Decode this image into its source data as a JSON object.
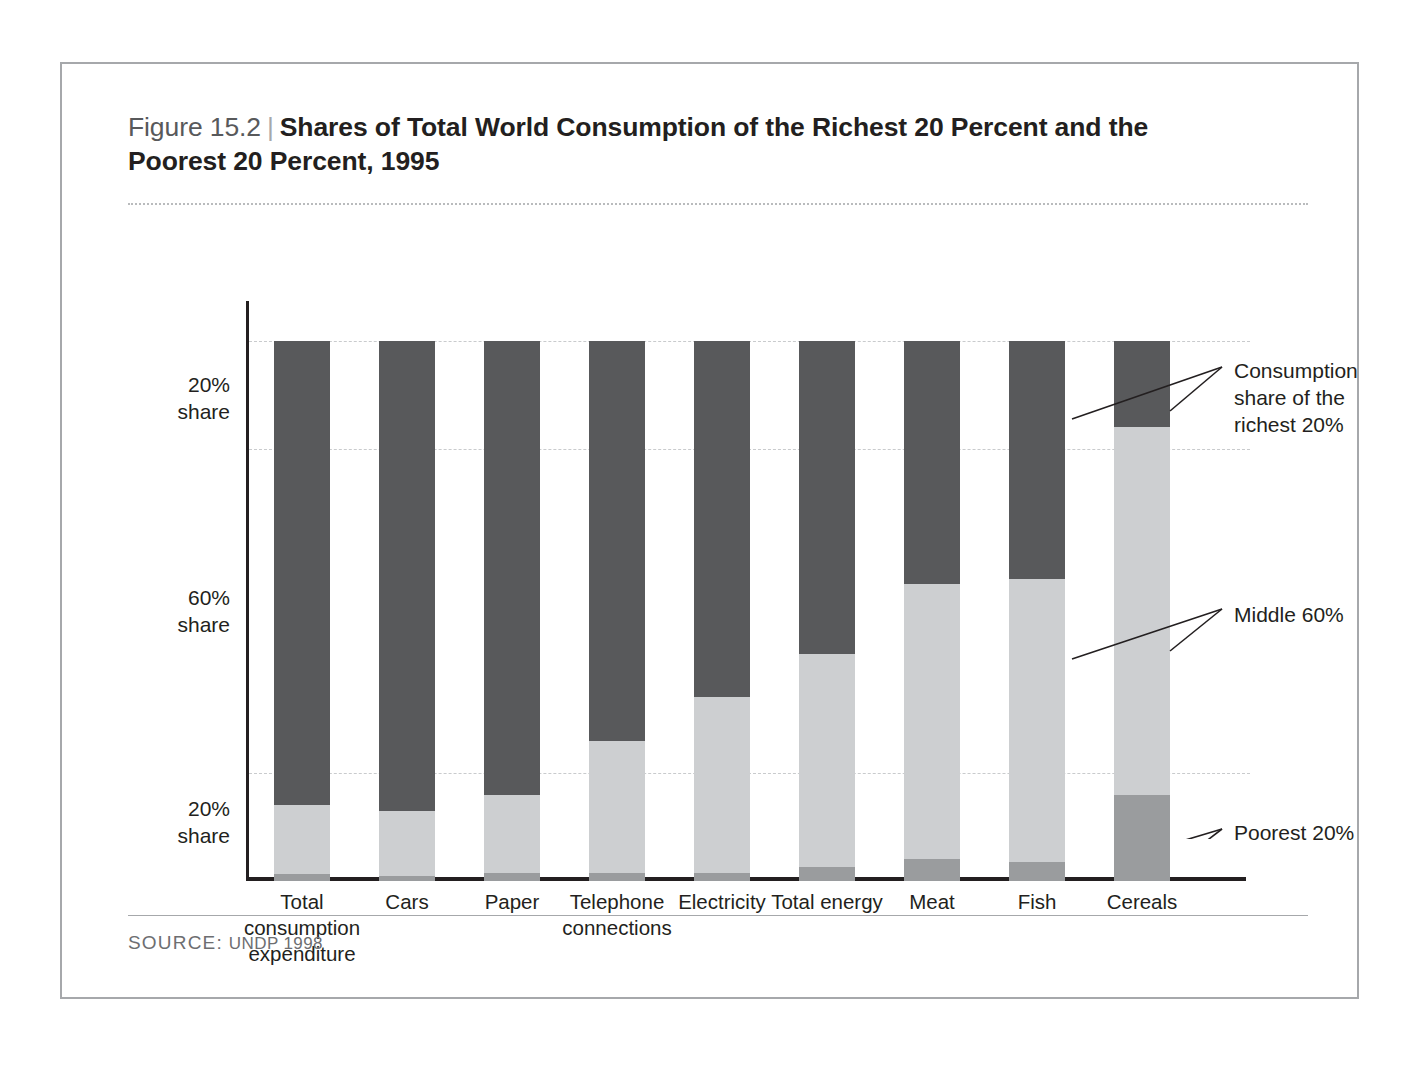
{
  "figure": {
    "number": "Figure 15.2",
    "separator": "|",
    "title": "Shares of Total World Consumption of the Richest 20 Percent and the Poorest 20 Percent, 1995",
    "source_label": "SOURCE:",
    "source_body": "UNDP 1998"
  },
  "axis": {
    "y_labels": [
      {
        "value": "20%",
        "unit": "share"
      },
      {
        "value": "60%",
        "unit": "share"
      },
      {
        "value": "20%",
        "unit": "share"
      }
    ]
  },
  "annotations": {
    "richest": "Consumption share of the richest 20%",
    "middle": "Middle 60%",
    "poorest": "Poorest 20%"
  },
  "colors": {
    "richest": "#58595b",
    "middle": "#cdcfd1",
    "poorest": "#9a9c9e",
    "frame": "#a6a8ab",
    "gridline": "#c9cbcd",
    "axis": "#231f20"
  },
  "chart_data": {
    "type": "bar",
    "subtype": "stacked-100-percent",
    "title": "Shares of Total World Consumption of the Richest 20 Percent and the Poorest 20 Percent, 1995",
    "xlabel": "",
    "ylabel": "",
    "ylim": [
      0,
      100
    ],
    "grid": true,
    "gridlines_at": [
      20,
      80,
      100
    ],
    "legend_position": "right-annotations",
    "categories": [
      "Total consumption expenditure",
      "Cars",
      "Paper",
      "Telephone connections",
      "Electricity",
      "Total energy",
      "Meat",
      "Fish",
      "Cereals"
    ],
    "series": [
      {
        "name": "Consumption share of the richest 20%",
        "color": "#58595b",
        "values": [
          86,
          87,
          84,
          74,
          66,
          58,
          45,
          44,
          16
        ]
      },
      {
        "name": "Middle 60%",
        "color": "#cdcfd1",
        "values": [
          12.7,
          12.0,
          14.5,
          24.5,
          32.5,
          39.5,
          51.0,
          52.5,
          68.0
        ]
      },
      {
        "name": "Poorest 20%",
        "color": "#9a9c9e",
        "values": [
          1.3,
          1.0,
          1.5,
          1.5,
          1.5,
          2.5,
          4.0,
          3.5,
          16.0
        ]
      }
    ]
  }
}
